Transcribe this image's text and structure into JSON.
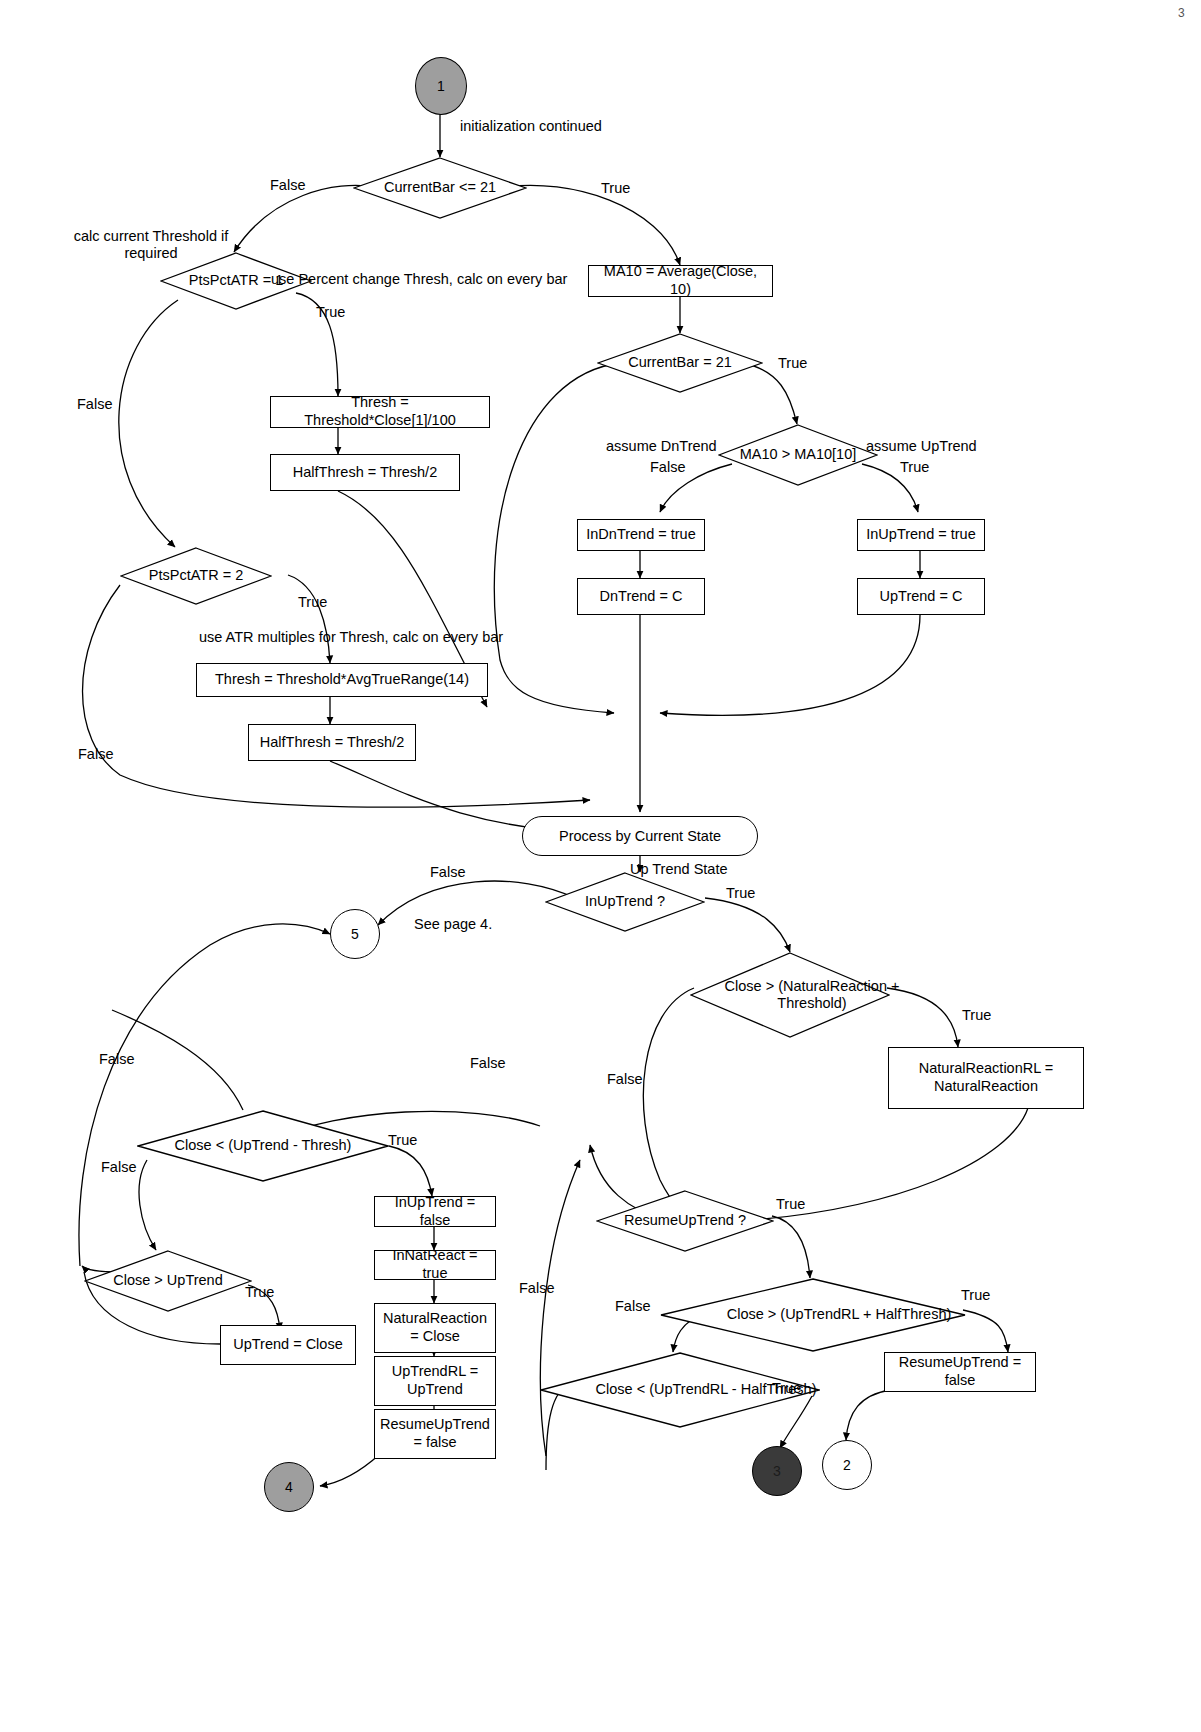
{
  "diagram": {
    "page_marker": "3",
    "connectors": [
      {
        "id": "c1",
        "label": "1",
        "style": "grey"
      },
      {
        "id": "c5",
        "label": "5",
        "style": "plain"
      },
      {
        "id": "c4",
        "label": "4",
        "style": "grey"
      },
      {
        "id": "c3",
        "label": "3",
        "style": "dark"
      },
      {
        "id": "c2",
        "label": "2",
        "style": "plain"
      }
    ],
    "decisions": [
      {
        "id": "d_currentbar_le",
        "label": "CurrentBar <= 21"
      },
      {
        "id": "d_ptspctatr1",
        "label": "PtsPctATR = 1"
      },
      {
        "id": "d_ptspctatr2",
        "label": "PtsPctATR = 2"
      },
      {
        "id": "d_currentbar_eq",
        "label": "CurrentBar = 21"
      },
      {
        "id": "d_ma10",
        "label": "MA10 > MA10[10]"
      },
      {
        "id": "d_inuptrend",
        "label": "InUpTrend ?"
      },
      {
        "id": "d_close_gt_nr",
        "label": "Close > (NaturalReaction + Threshold)"
      },
      {
        "id": "d_resumeuptrend",
        "label": "ResumeUpTrend ?"
      },
      {
        "id": "d_close_lt_up_thresh",
        "label": "Close < (UpTrend - Thresh)"
      },
      {
        "id": "d_close_gt_uptrend",
        "label": "Close > UpTrend"
      },
      {
        "id": "d_close_gt_uprl",
        "label": "Close > (UpTrendRL + HalfThresh)"
      },
      {
        "id": "d_close_lt_uprl",
        "label": "Close < (UpTrendRL - HalfThresh)"
      }
    ],
    "processes": [
      {
        "id": "p_ma10",
        "label": "MA10 = Average(Close, 10)"
      },
      {
        "id": "p_thresh_pct",
        "label": "Thresh = Threshold*Close[1]/100"
      },
      {
        "id": "p_halfthresh_pct",
        "label": "HalfThresh = Thresh/2"
      },
      {
        "id": "p_thresh_atr",
        "label": "Thresh = Threshold*AvgTrueRange(14)"
      },
      {
        "id": "p_halfthresh_atr",
        "label": "HalfThresh = Thresh/2"
      },
      {
        "id": "p_indntrend",
        "label": "InDnTrend = true"
      },
      {
        "id": "p_dntrend_c",
        "label": "DnTrend = C"
      },
      {
        "id": "p_inuptrend_true",
        "label": "InUpTrend = true"
      },
      {
        "id": "p_uptrend_c",
        "label": "UpTrend = C"
      },
      {
        "id": "p_nrrl",
        "label": "NaturalReactionRL = NaturalReaction"
      },
      {
        "id": "p_inuptrend_false",
        "label": "InUpTrend = false"
      },
      {
        "id": "p_innatreact",
        "label": "InNatReact = true"
      },
      {
        "id": "p_naturalreaction",
        "label": "NaturalReaction = Close"
      },
      {
        "id": "p_uptrendrl",
        "label": "UpTrendRL = UpTrend"
      },
      {
        "id": "p_resumeuptrend_false_a",
        "label": "ResumeUpTrend = false"
      },
      {
        "id": "p_uptrend_close",
        "label": "UpTrend = Close"
      },
      {
        "id": "p_resumeuptrend_false_b",
        "label": "ResumeUpTrend = false"
      }
    ],
    "terminals": [
      {
        "id": "t_process_state",
        "label": "Process by Current State"
      }
    ],
    "edge_labels": [
      {
        "id": "e_init",
        "text": "initialization continued"
      },
      {
        "id": "e_cb_false",
        "text": "False"
      },
      {
        "id": "e_cb_true",
        "text": "True"
      },
      {
        "id": "e_calc_thresh_note",
        "text": "calc current Threshold if required"
      },
      {
        "id": "e_pct_note",
        "text": "use Percent change Thresh, calc on every bar"
      },
      {
        "id": "e_ptspct1_true",
        "text": "True"
      },
      {
        "id": "e_ptspct1_false",
        "text": "False"
      },
      {
        "id": "e_ptspct2_true",
        "text": "True"
      },
      {
        "id": "e_ptspct2_false",
        "text": "False"
      },
      {
        "id": "e_atr_note",
        "text": "use ATR multiples for Thresh, calc on every bar"
      },
      {
        "id": "e_cbeq_true",
        "text": "True"
      },
      {
        "id": "e_assume_dn",
        "text": "assume DnTrend"
      },
      {
        "id": "e_ma10_false",
        "text": "False"
      },
      {
        "id": "e_assume_up",
        "text": "assume UpTrend"
      },
      {
        "id": "e_ma10_true",
        "text": "True"
      },
      {
        "id": "e_uptrend_state",
        "text": "Up Trend State"
      },
      {
        "id": "e_inup_false",
        "text": "False"
      },
      {
        "id": "e_inup_true",
        "text": "True"
      },
      {
        "id": "e_see_page4",
        "text": "See page 4."
      },
      {
        "id": "e_nr_true",
        "text": "True"
      },
      {
        "id": "e_nr_false",
        "text": "False"
      },
      {
        "id": "e_resume_true",
        "text": "True"
      },
      {
        "id": "e_resume_false",
        "text": "False"
      },
      {
        "id": "e_cltu_false_top",
        "text": "False"
      },
      {
        "id": "e_cltu_false_left",
        "text": "False"
      },
      {
        "id": "e_cltu_true",
        "text": "True"
      },
      {
        "id": "e_cltu_mid_false",
        "text": "False"
      },
      {
        "id": "e_cgu_false",
        "text": "False"
      },
      {
        "id": "e_cgu_true",
        "text": "True"
      },
      {
        "id": "e_cguprl_true",
        "text": "True"
      },
      {
        "id": "e_cguprl_false",
        "text": "False"
      },
      {
        "id": "e_cluprl_true",
        "text": "True"
      },
      {
        "id": "e_mid_false_col",
        "text": "False"
      }
    ]
  }
}
